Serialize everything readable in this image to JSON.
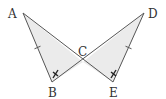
{
  "figure": {
    "colors": {
      "stroke": "#555555",
      "fill": "#ebebeb",
      "mark": "#222222",
      "label": "#333333"
    },
    "points": {
      "A": {
        "label": "A",
        "x": 23,
        "y": 13
      },
      "B": {
        "label": "B",
        "x": 52,
        "y": 82
      },
      "C": {
        "label": "C",
        "x": 83,
        "y": 62
      },
      "D": {
        "label": "D",
        "x": 144,
        "y": 13
      },
      "E": {
        "label": "E",
        "x": 113,
        "y": 82
      }
    },
    "triangles": [
      {
        "name": "triangle-ABC",
        "vertices": [
          "A",
          "B",
          "C"
        ]
      },
      {
        "name": "triangle-DEC",
        "vertices": [
          "D",
          "E",
          "C"
        ]
      }
    ],
    "segments": [
      {
        "from": "A",
        "to": "B"
      },
      {
        "from": "A",
        "to": "E"
      },
      {
        "from": "D",
        "to": "E"
      },
      {
        "from": "D",
        "to": "B"
      }
    ],
    "equal_side_marks": [
      {
        "segment": "AB",
        "ticks": 1
      },
      {
        "segment": "DE",
        "ticks": 1
      }
    ],
    "equal_angle_marks": [
      {
        "vertex": "B",
        "mark": "x"
      },
      {
        "vertex": "E",
        "mark": "x"
      }
    ]
  }
}
